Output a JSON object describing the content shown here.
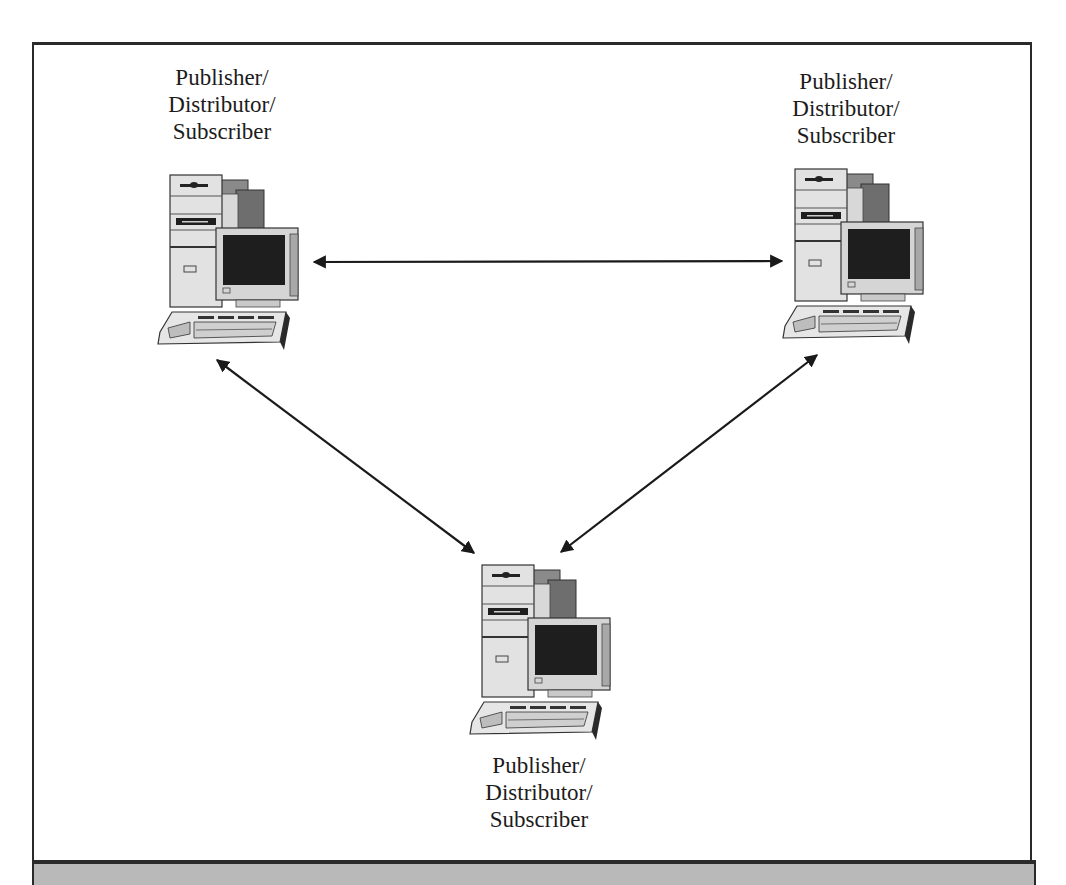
{
  "diagram": {
    "type": "peer-to-peer replication topology",
    "nodes": [
      {
        "id": "node-top-left",
        "icon": "desktop-computer-icon",
        "label_lines": [
          "Publisher/",
          "Distributor/",
          "Subscriber"
        ]
      },
      {
        "id": "node-top-right",
        "icon": "desktop-computer-icon",
        "label_lines": [
          "Publisher/",
          "Distributor/",
          "Subscriber"
        ]
      },
      {
        "id": "node-bottom",
        "icon": "desktop-computer-icon",
        "label_lines": [
          "Publisher/",
          "Distributor/",
          "Subscriber"
        ]
      }
    ],
    "edges": [
      {
        "from": "node-top-left",
        "to": "node-top-right",
        "direction": "bidirectional"
      },
      {
        "from": "node-top-left",
        "to": "node-bottom",
        "direction": "bidirectional"
      },
      {
        "from": "node-top-right",
        "to": "node-bottom",
        "direction": "bidirectional"
      }
    ],
    "colors": {
      "line": "#1a1a1a",
      "frame": "#2a2a2a",
      "caption_band": "#b9b9b9",
      "screen": "#1e1e1e",
      "case_light": "#e2e2e2",
      "case_dark": "#6e6e6e"
    }
  }
}
